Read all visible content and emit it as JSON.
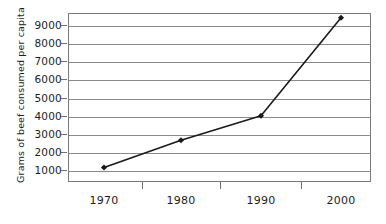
{
  "chart_data": {
    "type": "line",
    "title": "",
    "subtitle": "",
    "xlabel": "",
    "ylabel": "Grams of beef consumed per capita",
    "x": [
      "1970",
      "1980",
      "1990",
      "2000"
    ],
    "categories": [
      "1970",
      "1980",
      "1990",
      "2000"
    ],
    "values": [
      1150,
      2650,
      4000,
      9400
    ],
    "series": [
      {
        "name": "Grams of beef consumed per capita",
        "values": [
          1150,
          2650,
          4000,
          9400
        ]
      }
    ],
    "ylim": [
      0,
      9500
    ],
    "xlim": [
      "1970",
      "2000"
    ],
    "y_ticks": [
      1000,
      2000,
      3000,
      4000,
      5000,
      6000,
      7000,
      8000,
      9000
    ],
    "y_tick_labels": [
      "1000",
      "2000",
      "3000",
      "4000",
      "5000",
      "6000",
      "7000",
      "8000",
      "9000"
    ],
    "x_tick_labels": [
      "1970",
      "1980",
      "1990",
      "2000"
    ],
    "grid": "horizontal",
    "legend": "none",
    "marker": "diamond",
    "line_color": "#1a1a1a",
    "marker_color": "#1a1a1a",
    "grid_color": "#8a8a8a",
    "frame_color": "#7b7b7b",
    "background_color": "#ffffff",
    "annotations": []
  },
  "axis": {
    "y_title": "Grams of beef consumed per capita"
  }
}
